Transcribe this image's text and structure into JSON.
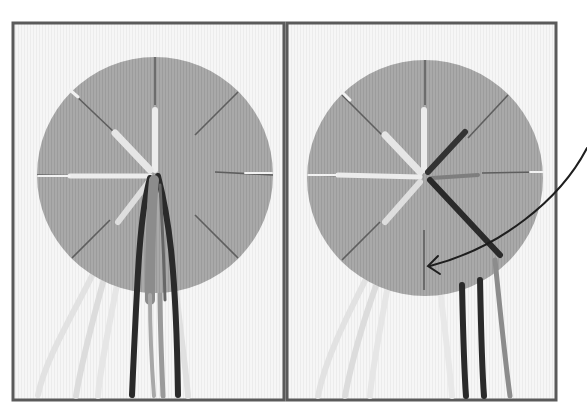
{
  "figure": {
    "colors": {
      "background": "#ffffff",
      "frame": "#5a5a5a",
      "panel_bg": "#f4f4f4",
      "disc": "#a9a9a9",
      "slot": "#5e5e5e",
      "thread_light": "#e8e8e8",
      "thread_mid": "#8c8c8c",
      "thread_dark": "#2a2a2a",
      "arrow": "#1e1e1e"
    },
    "panels": [
      {
        "id": "step-before",
        "disc_center": [
          155,
          175
        ],
        "disc_radius": 118
      },
      {
        "id": "step-after",
        "disc_center": [
          425,
          178
        ],
        "disc_radius": 118
      }
    ]
  }
}
